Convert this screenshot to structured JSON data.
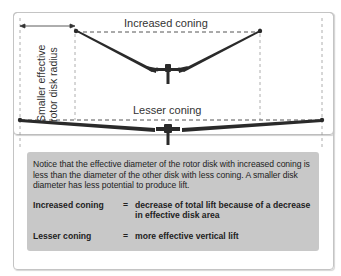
{
  "diagram": {
    "side_label_line1": "Smaller effective",
    "side_label_line2": "rotor disk radius",
    "top_rotor_label": "Increased coning",
    "bottom_rotor_label": "Lesser coning"
  },
  "note": {
    "paragraph": "Notice that the effective diameter of the rotor disk with increased coning is less than the diameter of the other disk with less coning. A smaller disk diameter has less potential to produce lift.",
    "equations": [
      {
        "term": "Increased coning",
        "sign": "=",
        "definition": "decrease of total lift because of a decrease in effective disk area"
      },
      {
        "term": "Lesser coning",
        "sign": "=",
        "definition": "more effective vertical lift"
      }
    ]
  },
  "colors": {
    "note_background": "#c8c8c8",
    "blade": "#2a2a2a",
    "dashed_line": "#888888",
    "frame_border": "#bdbdbd"
  }
}
